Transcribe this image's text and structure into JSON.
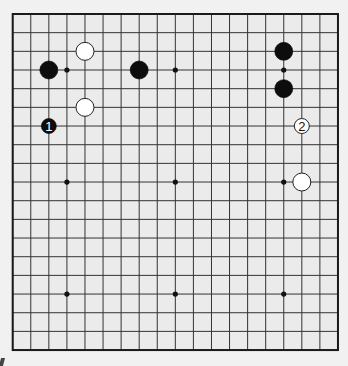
{
  "diagram": {
    "type": "go-board",
    "columns": 19,
    "rows": 19,
    "origin_x": 12.7,
    "origin_y": 14,
    "spacing_x": 18.07,
    "spacing_y": 18.67,
    "colors": {
      "board": "#ebebeb",
      "page": "#f1f1f1",
      "line": "#333333",
      "black_stone": "#0d0d0d",
      "white_stone": "#ffffff",
      "white_stone_edge": "#222222"
    },
    "star_points": [
      [
        3,
        3
      ],
      [
        9,
        3
      ],
      [
        15,
        3
      ],
      [
        3,
        9
      ],
      [
        9,
        9
      ],
      [
        15,
        9
      ],
      [
        3,
        15
      ],
      [
        9,
        15
      ],
      [
        15,
        15
      ]
    ],
    "stones": [
      {
        "color": "black",
        "col": 2,
        "row": 3,
        "label": ""
      },
      {
        "color": "white",
        "col": 4,
        "row": 2,
        "label": ""
      },
      {
        "color": "white",
        "col": 4,
        "row": 5,
        "label": ""
      },
      {
        "color": "black",
        "col": 7,
        "row": 3,
        "label": ""
      },
      {
        "color": "black",
        "col": 2,
        "row": 6,
        "label": "1"
      },
      {
        "color": "black",
        "col": 15,
        "row": 2,
        "label": ""
      },
      {
        "color": "black",
        "col": 15,
        "row": 4,
        "label": ""
      },
      {
        "color": "white",
        "col": 16,
        "row": 6,
        "label": "2"
      },
      {
        "color": "white",
        "col": 16,
        "row": 9,
        "label": ""
      }
    ]
  }
}
